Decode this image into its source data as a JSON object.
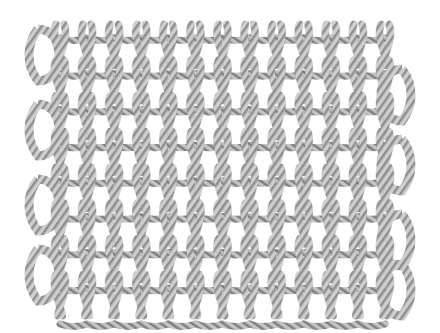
{
  "image": {
    "subject": "knitted rope fabric swatch",
    "style": "grayscale illustration",
    "background": "#ffffff",
    "fabric": {
      "left": 22,
      "top": 24,
      "right": 420,
      "bottom": 310,
      "columns": 13,
      "rows": 8,
      "cord_light": "#d9d9d9",
      "cord_mid": "#a8a8a8",
      "cord_dark": "#6e6e6e"
    }
  }
}
